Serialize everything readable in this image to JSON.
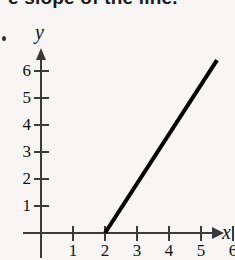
{
  "heading": {
    "text": "e slope of the line."
  },
  "figure": {
    "background_color": "#f7f6f4",
    "axis_color": "#3a3a3a",
    "line_color": "#000000"
  },
  "axes": {
    "x_name": "x",
    "y_name": "y"
  },
  "chart_data": {
    "type": "line",
    "title": "",
    "xlabel": "x",
    "ylabel": "y",
    "xlim": [
      0,
      6.5
    ],
    "ylim": [
      0,
      7
    ],
    "grid": false,
    "legend": false,
    "x_ticks": [
      1,
      2,
      3,
      4,
      5,
      6
    ],
    "x_tick_labels": [
      "1",
      "2",
      "3",
      "4",
      "5",
      "6"
    ],
    "y_ticks": [
      1,
      2,
      3,
      4,
      5,
      6
    ],
    "y_tick_labels": [
      "1",
      "2",
      "3",
      "4",
      "5",
      "6"
    ],
    "series": [
      {
        "name": "line",
        "x": [
          2,
          5.5
        ],
        "y": [
          0,
          6.4
        ],
        "color": "#000000",
        "linewidth": 4
      }
    ],
    "annotations": []
  }
}
